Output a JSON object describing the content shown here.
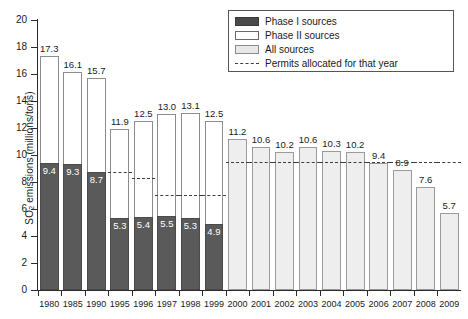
{
  "chart_data": {
    "type": "bar",
    "title": "",
    "xlabel": "",
    "ylabel": "SO2 emissions (millions/tons)",
    "ylabel_main": "SO",
    "ylabel_sub": "2",
    "ylabel_rest": " emissions (millions/tons)",
    "ylim": [
      0,
      20
    ],
    "yticks": [
      0,
      2,
      4,
      6,
      8,
      10,
      12,
      14,
      16,
      18,
      20
    ],
    "ytick_labels": [
      "0",
      "2",
      "4",
      "6",
      "8",
      "10",
      "12",
      "14",
      "16",
      "18",
      "20"
    ],
    "grid": false,
    "legend_position": "top-right",
    "categories": [
      "1980",
      "1985",
      "1990",
      "1995",
      "1996",
      "1997",
      "1998",
      "1999",
      "2000",
      "2001",
      "2002",
      "2003",
      "2004",
      "2005",
      "2006",
      "2007",
      "2008",
      "2009"
    ],
    "series": [
      {
        "name": "Phase II sources",
        "type": "total-bar",
        "values": [
          17.3,
          16.1,
          15.7,
          11.9,
          12.5,
          13.0,
          13.1,
          12.5,
          null,
          null,
          null,
          null,
          null,
          null,
          null,
          null,
          null,
          null
        ],
        "labels": [
          "17.3",
          "16.1",
          "15.7",
          "11.9",
          "12.5",
          "13.0",
          "13.1",
          "12.5",
          "",
          "",
          "",
          "",
          "",
          "",
          "",
          "",
          "",
          ""
        ]
      },
      {
        "name": "Phase I sources",
        "type": "sub-bar",
        "values": [
          9.4,
          9.3,
          8.7,
          5.3,
          5.4,
          5.5,
          5.3,
          4.9,
          null,
          null,
          null,
          null,
          null,
          null,
          null,
          null,
          null,
          null
        ],
        "labels": [
          "9.4",
          "9.3",
          "8.7",
          "5.3",
          "5.4",
          "5.5",
          "5.3",
          "4.9",
          "",
          "",
          "",
          "",
          "",
          "",
          "",
          "",
          "",
          ""
        ]
      },
      {
        "name": "All sources",
        "type": "total-bar",
        "values": [
          null,
          null,
          null,
          null,
          null,
          null,
          null,
          null,
          11.2,
          10.6,
          10.2,
          10.6,
          10.3,
          10.2,
          9.4,
          8.9,
          7.6,
          5.7
        ],
        "labels": [
          "",
          "",
          "",
          "",
          "",
          "",
          "",
          "",
          "11.2",
          "10.6",
          "10.2",
          "10.6",
          "10.3",
          "10.2",
          "9.4",
          "8.9",
          "7.6",
          "5.7"
        ]
      },
      {
        "name": "Permits allocated for that year",
        "type": "step-line",
        "values": [
          null,
          null,
          null,
          8.7,
          8.3,
          7.0,
          7.0,
          7.0,
          9.5,
          9.5,
          9.5,
          9.5,
          9.5,
          9.5,
          9.5,
          9.5,
          9.5,
          9.5
        ]
      }
    ],
    "legend_entries": [
      {
        "label": "Phase I sources",
        "swatch": "phase1",
        "color": "#4a4a4a"
      },
      {
        "label": "Phase II sources",
        "swatch": "phase2",
        "color": "#ffffff"
      },
      {
        "label": "All sources",
        "swatch": "all",
        "color": "#e8e8e8"
      },
      {
        "label": "Permits allocated for that year",
        "swatch": "permit",
        "color": "#3d3d3d"
      }
    ]
  }
}
